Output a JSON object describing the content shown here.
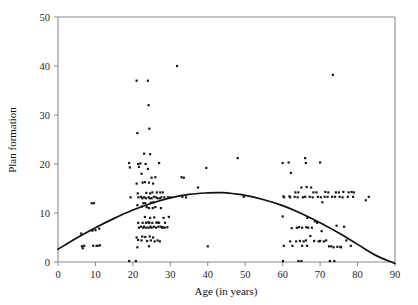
{
  "chart_data": {
    "type": "scatter",
    "title": "",
    "xlabel": "Age (in years)",
    "ylabel": "Plan formation",
    "xlim": [
      0,
      90
    ],
    "ylim": [
      0,
      50
    ],
    "xticks": [
      0,
      10,
      20,
      30,
      40,
      50,
      60,
      70,
      80,
      90
    ],
    "yticks": [
      0,
      10,
      20,
      30,
      40,
      50
    ],
    "grid": false,
    "legend": null,
    "point_color": "#171717",
    "curve_color": "#111111",
    "axis_color": "#8a8a8a",
    "series": [
      {
        "name": "observations",
        "marker": "square",
        "points": [
          [
            6.2,
            5.8
          ],
          [
            6.4,
            3.2
          ],
          [
            6.6,
            2.8
          ],
          [
            7.0,
            3.3
          ],
          [
            9.0,
            12.0
          ],
          [
            9.6,
            12.0
          ],
          [
            9.2,
            6.4
          ],
          [
            9.4,
            3.3
          ],
          [
            10.0,
            6.5
          ],
          [
            10.3,
            3.3
          ],
          [
            10.6,
            3.3
          ],
          [
            11.0,
            6.8
          ],
          [
            11.2,
            3.4
          ],
          [
            19.0,
            20.2
          ],
          [
            19.2,
            19.3
          ],
          [
            19.4,
            13.2
          ],
          [
            19.0,
            0.2
          ],
          [
            20.8,
            0.2
          ],
          [
            21.0,
            37.0
          ],
          [
            21.2,
            26.3
          ],
          [
            21.4,
            20.0
          ],
          [
            21.6,
            19.4
          ],
          [
            21.0,
            16.0
          ],
          [
            21.3,
            14.0
          ],
          [
            21.5,
            13.2
          ],
          [
            21.2,
            11.6
          ],
          [
            21.4,
            8.0
          ],
          [
            21.6,
            7.0
          ],
          [
            21.0,
            5.0
          ],
          [
            21.4,
            4.5
          ],
          [
            21.2,
            3.0
          ],
          [
            22.0,
            20.1
          ],
          [
            22.3,
            18.0
          ],
          [
            22.6,
            16.2
          ],
          [
            22.2,
            13.3
          ],
          [
            22.5,
            13.0
          ],
          [
            22.8,
            12.0
          ],
          [
            22.4,
            11.3
          ],
          [
            22.6,
            8.0
          ],
          [
            22.2,
            7.2
          ],
          [
            22.8,
            7.0
          ],
          [
            22.5,
            5.2
          ],
          [
            22.3,
            4.4
          ],
          [
            23.0,
            22.1
          ],
          [
            23.4,
            20.0
          ],
          [
            23.2,
            16.3
          ],
          [
            23.6,
            14.1
          ],
          [
            23.0,
            13.2
          ],
          [
            23.5,
            13.0
          ],
          [
            23.3,
            12.0
          ],
          [
            23.7,
            11.2
          ],
          [
            23.2,
            9.2
          ],
          [
            23.5,
            8.0
          ],
          [
            23.0,
            7.2
          ],
          [
            23.6,
            7.0
          ],
          [
            23.3,
            5.1
          ],
          [
            23.8,
            4.3
          ],
          [
            24.0,
            37.0
          ],
          [
            24.2,
            32.0
          ],
          [
            24.4,
            27.2
          ],
          [
            24.6,
            22.0
          ],
          [
            24.0,
            19.0
          ],
          [
            24.3,
            16.2
          ],
          [
            24.6,
            14.0
          ],
          [
            24.2,
            13.2
          ],
          [
            24.5,
            13.0
          ],
          [
            24.8,
            12.1
          ],
          [
            24.3,
            11.0
          ],
          [
            24.6,
            9.0
          ],
          [
            24.1,
            8.1
          ],
          [
            24.4,
            8.0
          ],
          [
            24.7,
            7.2
          ],
          [
            24.2,
            7.0
          ],
          [
            24.5,
            5.2
          ],
          [
            24.8,
            4.4
          ],
          [
            24.3,
            3.2
          ],
          [
            25.0,
            17.2
          ],
          [
            25.4,
            16.0
          ],
          [
            25.2,
            14.2
          ],
          [
            25.6,
            13.3
          ],
          [
            25.0,
            13.0
          ],
          [
            25.5,
            12.2
          ],
          [
            25.3,
            11.0
          ],
          [
            25.7,
            9.1
          ],
          [
            25.2,
            8.0
          ],
          [
            25.6,
            7.2
          ],
          [
            25.0,
            7.0
          ],
          [
            25.4,
            5.0
          ],
          [
            25.8,
            4.2
          ],
          [
            26.0,
            17.3
          ],
          [
            26.4,
            14.2
          ],
          [
            26.2,
            13.2
          ],
          [
            26.6,
            13.0
          ],
          [
            26.0,
            11.2
          ],
          [
            26.5,
            8.1
          ],
          [
            26.3,
            8.0
          ],
          [
            26.8,
            7.2
          ],
          [
            26.2,
            7.0
          ],
          [
            26.6,
            4.4
          ],
          [
            27.0,
            20.2
          ],
          [
            27.3,
            14.2
          ],
          [
            27.6,
            13.2
          ],
          [
            27.2,
            13.0
          ],
          [
            27.5,
            11.0
          ],
          [
            27.0,
            8.0
          ],
          [
            27.4,
            7.2
          ],
          [
            27.8,
            7.0
          ],
          [
            27.2,
            4.2
          ],
          [
            28.0,
            14.2
          ],
          [
            28.4,
            13.2
          ],
          [
            28.2,
            9.0
          ],
          [
            28.6,
            8.0
          ],
          [
            28.0,
            7.1
          ],
          [
            28.5,
            7.0
          ],
          [
            29.4,
            13.2
          ],
          [
            29.6,
            9.2
          ],
          [
            29.2,
            7.1
          ],
          [
            30.0,
            13.2
          ],
          [
            31.8,
            40.0
          ],
          [
            33.0,
            17.3
          ],
          [
            33.6,
            17.2
          ],
          [
            33.2,
            13.3
          ],
          [
            34.2,
            13.2
          ],
          [
            37.4,
            15.2
          ],
          [
            39.6,
            19.2
          ],
          [
            40.0,
            3.2
          ],
          [
            48.0,
            21.2
          ],
          [
            49.6,
            13.3
          ],
          [
            60.0,
            20.2
          ],
          [
            60.2,
            13.4
          ],
          [
            60.4,
            13.2
          ],
          [
            60.0,
            9.3
          ],
          [
            60.3,
            3.3
          ],
          [
            60.1,
            0.2
          ],
          [
            61.6,
            20.3
          ],
          [
            61.8,
            13.4
          ],
          [
            62.0,
            13.2
          ],
          [
            62.2,
            18.2
          ],
          [
            62.4,
            6.9
          ],
          [
            62.0,
            4.2
          ],
          [
            62.6,
            3.3
          ],
          [
            63.4,
            14.2
          ],
          [
            63.2,
            13.3
          ],
          [
            63.8,
            7.0
          ],
          [
            63.6,
            4.2
          ],
          [
            64.2,
            14.2
          ],
          [
            64.0,
            13.2
          ],
          [
            64.4,
            7.1
          ],
          [
            64.6,
            4.3
          ],
          [
            64.2,
            0.2
          ],
          [
            65.0,
            15.2
          ],
          [
            65.4,
            13.2
          ],
          [
            65.2,
            7.0
          ],
          [
            65.6,
            4.2
          ],
          [
            65.2,
            3.3
          ],
          [
            65.0,
            0.2
          ],
          [
            66.0,
            21.2
          ],
          [
            66.2,
            20.2
          ],
          [
            66.4,
            15.3
          ],
          [
            66.0,
            13.3
          ],
          [
            66.6,
            9.0
          ],
          [
            66.3,
            7.1
          ],
          [
            66.8,
            7.0
          ],
          [
            66.2,
            4.4
          ],
          [
            66.5,
            3.3
          ],
          [
            67.6,
            15.2
          ],
          [
            67.2,
            13.3
          ],
          [
            67.8,
            7.0
          ],
          [
            67.4,
            5.3
          ],
          [
            68.2,
            14.2
          ],
          [
            68.0,
            13.2
          ],
          [
            68.6,
            8.3
          ],
          [
            68.4,
            4.3
          ],
          [
            69.0,
            14.2
          ],
          [
            69.4,
            13.3
          ],
          [
            69.2,
            8.0
          ],
          [
            69.6,
            4.2
          ],
          [
            70.0,
            20.3
          ],
          [
            70.2,
            13.2
          ],
          [
            70.6,
            12.2
          ],
          [
            70.4,
            6.3
          ],
          [
            70.0,
            4.3
          ],
          [
            71.4,
            14.3
          ],
          [
            71.2,
            13.3
          ],
          [
            71.6,
            4.4
          ],
          [
            71.0,
            4.2
          ],
          [
            72.2,
            14.2
          ],
          [
            72.0,
            13.3
          ],
          [
            72.4,
            3.2
          ],
          [
            72.6,
            0.2
          ],
          [
            73.4,
            38.2
          ],
          [
            73.2,
            13.3
          ],
          [
            73.0,
            3.2
          ],
          [
            73.6,
            3.0
          ],
          [
            73.8,
            0.2
          ],
          [
            74.2,
            14.2
          ],
          [
            74.0,
            13.3
          ],
          [
            74.4,
            7.4
          ],
          [
            74.6,
            3.1
          ],
          [
            75.0,
            14.2
          ],
          [
            75.2,
            13.3
          ],
          [
            75.4,
            3.1
          ],
          [
            75.6,
            3.0
          ],
          [
            76.2,
            14.3
          ],
          [
            76.0,
            13.2
          ],
          [
            76.4,
            7.2
          ],
          [
            77.6,
            14.2
          ],
          [
            77.4,
            13.3
          ],
          [
            77.0,
            4.4
          ],
          [
            78.4,
            14.3
          ],
          [
            78.8,
            13.3
          ],
          [
            78.2,
            3.3
          ],
          [
            79.0,
            14.2
          ],
          [
            82.2,
            12.6
          ],
          [
            83.0,
            13.3
          ]
        ]
      }
    ],
    "fit_curve": {
      "name": "quadratic fit",
      "description": "inverted-U regression line",
      "points": [
        [
          0,
          2.6
        ],
        [
          5,
          4.9
        ],
        [
          10,
          7.0
        ],
        [
          15,
          8.9
        ],
        [
          20,
          10.6
        ],
        [
          25,
          12.0
        ],
        [
          30,
          13.1
        ],
        [
          35,
          13.8
        ],
        [
          40,
          14.1
        ],
        [
          43,
          14.15
        ],
        [
          45,
          14.1
        ],
        [
          50,
          13.6
        ],
        [
          55,
          12.7
        ],
        [
          60,
          11.5
        ],
        [
          65,
          9.9
        ],
        [
          70,
          8.0
        ],
        [
          75,
          5.9
        ],
        [
          80,
          3.6
        ],
        [
          85,
          1.3
        ],
        [
          90,
          -0.3
        ]
      ]
    }
  }
}
